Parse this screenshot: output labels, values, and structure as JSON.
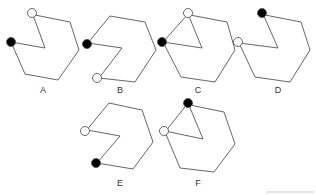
{
  "figures": [
    {
      "label": "A",
      "label_pos": [
        33,
        90
      ]
    },
    {
      "label": "B",
      "label_pos": [
        110,
        90
      ]
    },
    {
      "label": "C",
      "label_pos": [
        196,
        90
      ]
    },
    {
      "label": "D",
      "label_pos": [
        273,
        90
      ]
    },
    {
      "label": "E",
      "label_pos": [
        116,
        182
      ]
    },
    {
      "label": "F",
      "label_pos": [
        194,
        182
      ]
    }
  ],
  "colors": {
    "stroke": "#555555",
    "filled": "#000000",
    "open_fill": "#ffffff"
  }
}
